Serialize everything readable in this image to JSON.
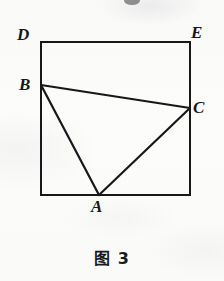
{
  "figure": {
    "caption": "图 3",
    "shape_type": "rectangle-with-inscribed-triangle",
    "stroke_color": "#18181b",
    "background_color": "#fbfbfa",
    "stroke_width": 2,
    "rectangle": {
      "name": "outer-rectangle",
      "corners": {
        "top_left": [
          41,
          42
        ],
        "top_right": [
          190,
          42
        ],
        "bottom_right": [
          190,
          195
        ],
        "bottom_left": [
          41,
          195
        ]
      }
    },
    "points": [
      {
        "id": "D",
        "label": "D",
        "x": 41,
        "y": 42,
        "on": "rectangle-top-left-corner"
      },
      {
        "id": "E",
        "label": "E",
        "x": 190,
        "y": 42,
        "on": "rectangle-top-right-corner"
      },
      {
        "id": "B",
        "label": "B",
        "x": 41,
        "y": 85,
        "on": "rectangle-left-edge"
      },
      {
        "id": "C",
        "label": "C",
        "x": 190,
        "y": 108,
        "on": "rectangle-right-edge"
      },
      {
        "id": "A",
        "label": "A",
        "x": 99,
        "y": 195,
        "on": "rectangle-bottom-edge"
      }
    ],
    "segments": [
      {
        "id": "BC",
        "from": "B",
        "to": "C",
        "points": [
          41,
          85,
          190,
          108
        ]
      },
      {
        "id": "BA",
        "from": "B",
        "to": "A",
        "points": [
          41,
          85,
          99,
          195
        ]
      },
      {
        "id": "AC",
        "from": "A",
        "to": "C",
        "points": [
          99,
          195,
          190,
          108
        ]
      }
    ],
    "labels": {
      "D": "D",
      "E": "E",
      "B": "B",
      "C": "C",
      "A": "A"
    }
  }
}
